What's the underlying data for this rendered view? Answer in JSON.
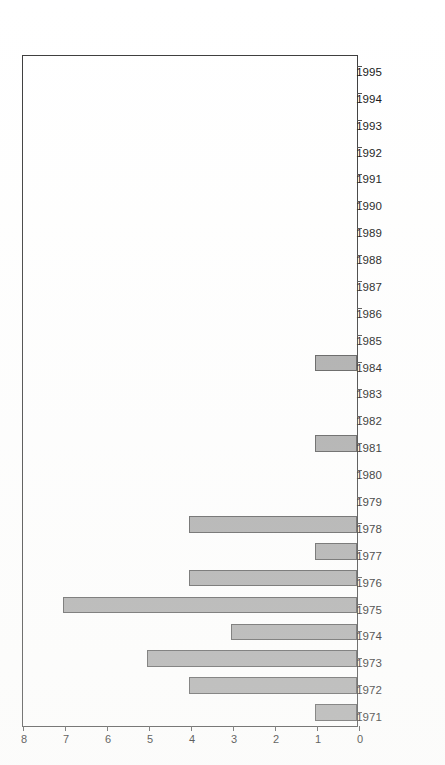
{
  "figure": {
    "background_color": "#ffffff",
    "orientation": "rotated-90",
    "frame_color": "#3a3a3a",
    "bar_fill_color": "#a8a8a8",
    "bar_edge_color": "#545454"
  },
  "chart_data": {
    "type": "bar",
    "title": "",
    "subtitle": "",
    "xlabel": "",
    "ylabel": "",
    "orientation": "vertical",
    "grid": false,
    "legend": false,
    "legend_position": "none",
    "xlim": [
      1970.5,
      1995.5
    ],
    "ylim": [
      0,
      8
    ],
    "yticks": [
      0,
      1,
      2,
      3,
      4,
      5,
      6,
      7,
      8
    ],
    "ytick_labels": [
      "0",
      "1",
      "2",
      "3",
      "4",
      "5",
      "6",
      "7",
      "8"
    ],
    "categories": [
      "1971",
      "1972",
      "1973",
      "1974",
      "1975",
      "1976",
      "1977",
      "1978",
      "1979",
      "1980",
      "1981",
      "1982",
      "1983",
      "1984",
      "1985",
      "1986",
      "1987",
      "1988",
      "1989",
      "1990",
      "1991",
      "1992",
      "1993",
      "1994",
      "1995"
    ],
    "values": [
      1,
      4,
      5,
      3,
      7,
      4,
      1,
      4,
      0,
      0,
      1,
      0,
      0,
      1,
      0,
      0,
      0,
      0,
      0,
      0,
      0,
      0,
      0,
      0,
      0
    ],
    "annotations": []
  }
}
